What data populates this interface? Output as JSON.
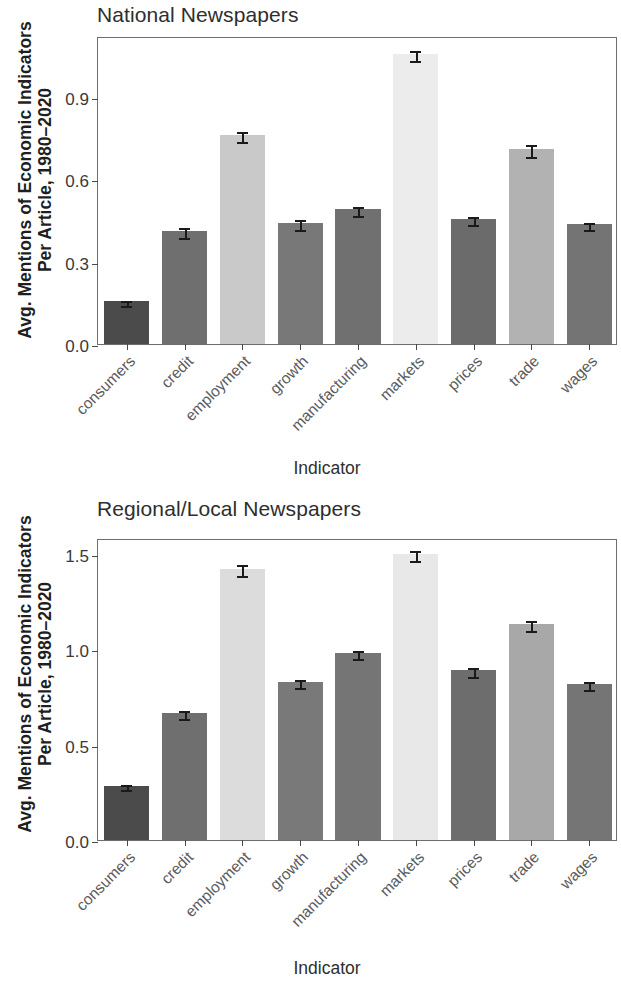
{
  "figure": {
    "y_axis_title_line1": "Avg. Mentions of Economic Indicators",
    "y_axis_title_line2": "Per Article, 1980–2020",
    "x_axis_title": "Indicator"
  },
  "chart_data": [
    {
      "type": "bar",
      "title": "National Newspapers",
      "xlabel": "Indicator",
      "ylabel": "Avg. Mentions of Economic Indicators Per Article, 1980–2020",
      "categories": [
        "consumers",
        "credit",
        "employment",
        "growth",
        "manufacturing",
        "markets",
        "prices",
        "trade",
        "wages"
      ],
      "values": [
        0.155,
        0.41,
        0.76,
        0.44,
        0.49,
        1.055,
        0.455,
        0.71,
        0.435
      ],
      "errors": [
        0.008,
        0.018,
        0.018,
        0.017,
        0.016,
        0.018,
        0.014,
        0.021,
        0.012
      ],
      "bar_colors": [
        "#4b4b4b",
        "#6f6f6f",
        "#c9c9c9",
        "#787878",
        "#707070",
        "#ececec",
        "#6b6b6b",
        "#b2b2b2",
        "#747474"
      ],
      "yticks": [
        0.0,
        0.3,
        0.6,
        0.9
      ],
      "ytick_labels": [
        "0.0",
        "0.3",
        "0.6",
        "0.9"
      ],
      "ylim": [
        0,
        1.12
      ],
      "grid": false,
      "legend": "none"
    },
    {
      "type": "bar",
      "title": "Regional/Local Newspapers",
      "xlabel": "Indicator",
      "ylabel": "Avg. Mentions of Economic Indicators Per Article, 1980–2020",
      "categories": [
        "consumers",
        "credit",
        "employment",
        "growth",
        "manufacturing",
        "markets",
        "prices",
        "trade",
        "wages"
      ],
      "values": [
        0.285,
        0.665,
        1.425,
        0.83,
        0.98,
        1.5,
        0.89,
        1.135,
        0.82
      ],
      "errors": [
        0.013,
        0.022,
        0.027,
        0.021,
        0.021,
        0.026,
        0.023,
        0.026,
        0.021
      ],
      "bar_colors": [
        "#4b4b4b",
        "#6f6f6f",
        "#dcdcdc",
        "#797979",
        "#757575",
        "#e8e8e8",
        "#6d6d6d",
        "#a8a8a8",
        "#757575"
      ],
      "yticks": [
        0.0,
        0.5,
        1.0,
        1.5
      ],
      "ytick_labels": [
        "0.0",
        "0.5",
        "1.0",
        "1.5"
      ],
      "ylim": [
        0,
        1.585
      ],
      "grid": false,
      "legend": "none"
    }
  ]
}
